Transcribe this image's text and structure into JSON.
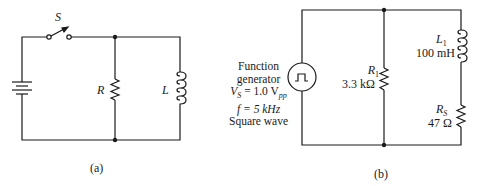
{
  "circuit_a": {
    "caption": "(a)",
    "switch_label": "S",
    "resistor_label": "R",
    "inductor_label": "L"
  },
  "circuit_b": {
    "caption": "(b)",
    "generator": {
      "line1": "Function",
      "line2": "generator",
      "vs_symbol": "V",
      "vs_sub": "S",
      "vs_value": "= 1.0 V",
      "vs_unit_sub": "pp",
      "freq": "f = 5 kHz",
      "waveform": "Square wave"
    },
    "r1": {
      "symbol": "R",
      "sub": "1",
      "value": "3.3 kΩ"
    },
    "l1": {
      "symbol": "L",
      "sub": "1",
      "value": "100 mH"
    },
    "rs": {
      "symbol": "R",
      "sub": "S",
      "value": "47 Ω"
    }
  },
  "colors": {
    "line": "#1a1a1a",
    "background": "#ffffff"
  }
}
